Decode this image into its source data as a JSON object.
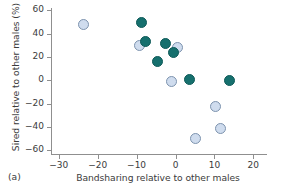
{
  "panel": {
    "label": "(a)"
  },
  "colors": {
    "dark_marker": "#16706E",
    "dark_marker_edge": "#0D5A58",
    "light_marker": "#CFDCEE",
    "light_marker_edge": "#7D93AE",
    "axis": "#8F8F8F",
    "text": "#3B3B3B",
    "background": "#FFFFFF"
  },
  "chart_data": {
    "type": "scatter",
    "title": "",
    "xlabel": "Bandsharing relative to other males",
    "ylabel": "Sired relative to other males (%)",
    "xlim": [
      -32,
      23
    ],
    "ylim": [
      -63,
      62
    ],
    "xticks": [
      -30,
      -20,
      -10,
      0,
      10,
      20
    ],
    "xtick_labels": [
      "−30",
      "−20",
      "−10",
      "0",
      "10",
      "20"
    ],
    "yticks": [
      60,
      40,
      20,
      0,
      -20,
      -40,
      -60
    ],
    "ytick_labels": [
      "60",
      "40",
      "20",
      "0",
      "−20",
      "−40",
      "−60"
    ],
    "grid": false,
    "legend": null,
    "series": [
      {
        "name": "dark-teal-filled",
        "marker": "circle",
        "color": "#16706E",
        "points": [
          {
            "x": -8.8,
            "y": 49.5
          },
          {
            "x": -7.7,
            "y": 33.5
          },
          {
            "x": -2.6,
            "y": 31.5
          },
          {
            "x": -0.6,
            "y": 23.5
          },
          {
            "x": -4.6,
            "y": 16.5
          },
          {
            "x": 3.7,
            "y": 0.5
          },
          {
            "x": 13.9,
            "y": 0.0
          }
        ]
      },
      {
        "name": "light-blue-filled",
        "marker": "circle",
        "color": "#CFDCEE",
        "points": [
          {
            "x": -23.6,
            "y": 48.0
          },
          {
            "x": -9.2,
            "y": 30.0
          },
          {
            "x": 0.4,
            "y": 28.0
          },
          {
            "x": -1.1,
            "y": -0.8
          },
          {
            "x": 10.2,
            "y": -22.7
          },
          {
            "x": 11.6,
            "y": -40.8
          },
          {
            "x": 5.1,
            "y": -49.8
          }
        ]
      }
    ]
  }
}
